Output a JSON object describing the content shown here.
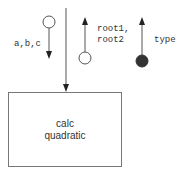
{
  "diagram": {
    "type": "structure-chart",
    "module": {
      "label_line1": "calc",
      "label_line2": "quadratic"
    },
    "couples": [
      {
        "id": "input",
        "label": "a,b,c",
        "kind": "data",
        "direction": "down"
      },
      {
        "id": "output-roots",
        "label_line1": "root1,",
        "label_line2": "root2",
        "kind": "data",
        "direction": "up"
      },
      {
        "id": "output-type",
        "label": "type",
        "kind": "control",
        "direction": "up"
      }
    ],
    "colors": {
      "line": "#555555",
      "box_border": "#777777",
      "control_fill": "#333333",
      "text": "#333333"
    }
  }
}
